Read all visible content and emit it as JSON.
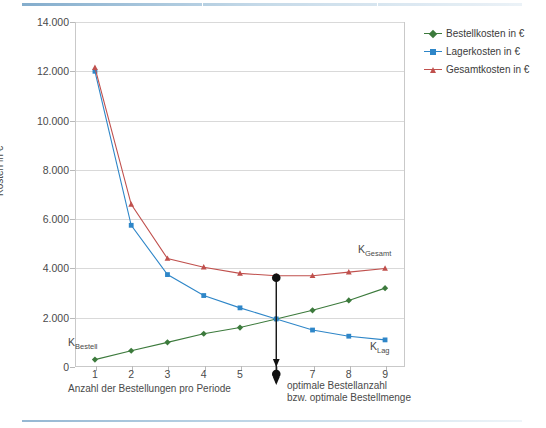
{
  "chart_data": {
    "type": "line",
    "title": "",
    "xlabel": "Anzahl der Bestellungen pro Periode",
    "ylabel": "Kosten in €",
    "x": [
      1,
      2,
      3,
      4,
      5,
      6,
      7,
      8,
      9
    ],
    "xlim": [
      0.45,
      9.55
    ],
    "ylim": [
      0,
      14000
    ],
    "yticks": [
      0,
      2000,
      4000,
      6000,
      8000,
      10000,
      12000,
      14000
    ],
    "ytick_labels": [
      "0",
      "2.000",
      "4.000",
      "6.000",
      "8.000",
      "10.000",
      "12.000",
      "14.000"
    ],
    "xtick_labels": [
      "1",
      "2",
      "3",
      "4",
      "5",
      "6",
      "7",
      "8",
      "9"
    ],
    "grid": "horizontal",
    "legend_position": "right-top",
    "series": [
      {
        "name": "Bestellkosten in €",
        "color": "#3c7a3c",
        "marker": "diamond",
        "values": [
          300,
          660,
          1000,
          1350,
          1600,
          1950,
          2300,
          2700,
          3200
        ]
      },
      {
        "name": "Lagerkosten in €",
        "color": "#2e86c8",
        "marker": "square",
        "values": [
          12000,
          5750,
          3750,
          2900,
          2400,
          1950,
          1500,
          1250,
          1100
        ]
      },
      {
        "name": "Gesamtkosten in €",
        "color": "#c0504d",
        "marker": "triangle",
        "values": [
          12150,
          6600,
          4400,
          4050,
          3800,
          3700,
          3700,
          3850,
          4000
        ]
      }
    ],
    "annotations": [
      {
        "name": "k-bestell-label",
        "text": "K",
        "sub": "Bestell",
        "x": 1.25,
        "y": 2500
      },
      {
        "name": "k-lag-label",
        "text": "K",
        "sub": "Lag",
        "x": 8.55,
        "y": 1750
      },
      {
        "name": "k-gesamt-label",
        "text": "K",
        "sub": "Gesamt",
        "x": 8.4,
        "y": 4850
      },
      {
        "name": "optimum-marker",
        "text": "",
        "sub": "",
        "x": 6,
        "y": 3700
      }
    ],
    "optimum": {
      "x": 6,
      "note_line1": "optimale Bestellanzahl",
      "note_line2": "bzw. optimale Bestellmenge",
      "marker_color": "#111111"
    }
  },
  "legend": {
    "items": [
      {
        "label": "Bestellkosten in €",
        "color": "#3c7a3c",
        "marker": "diamond"
      },
      {
        "label": "Lagerkosten in €",
        "color": "#2e86c8",
        "marker": "square"
      },
      {
        "label": "Gesamtkosten in €",
        "color": "#c0504d",
        "marker": "triangle"
      }
    ]
  },
  "axes": {
    "y_title": "Kosten in €",
    "x_title": "Anzahl der Bestellungen pro Periode"
  },
  "curve_labels": {
    "bestell_main": "K",
    "bestell_sub": "Bestell",
    "lag_main": "K",
    "lag_sub": "Lag",
    "gesamt_main": "K",
    "gesamt_sub": "Gesamt"
  },
  "optimum_note": {
    "line1": "optimale Bestellanzahl",
    "line2": "bzw. optimale Bestellmenge"
  }
}
